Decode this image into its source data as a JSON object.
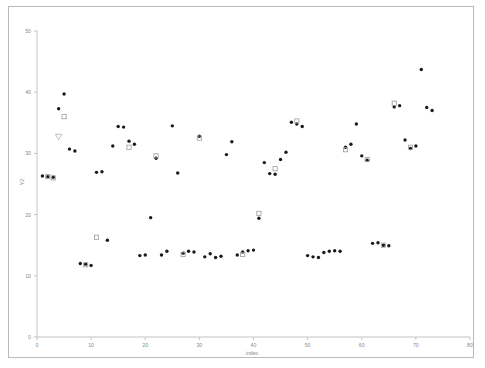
{
  "chart_data": {
    "type": "scatter",
    "title": "",
    "xlabel": "index",
    "ylabel": "Y2",
    "xlim": [
      0,
      80
    ],
    "ylim": [
      0,
      50
    ],
    "xticks": [
      0,
      10,
      20,
      30,
      40,
      50,
      60,
      70,
      80
    ],
    "yticks": [
      0,
      10,
      20,
      30,
      40,
      50
    ],
    "xtick_labels": [
      "0",
      "10",
      "20",
      "30",
      "40",
      "50",
      "60",
      "70",
      "80"
    ],
    "ytick_labels": [
      "0",
      "10",
      "20",
      "30",
      "40",
      "50"
    ],
    "grid": false,
    "legend": null,
    "series": [
      {
        "name": "filled-circle",
        "marker": "circle-filled",
        "color": "#1a1a1a",
        "points": [
          [
            1,
            26.3
          ],
          [
            2,
            26.2
          ],
          [
            3,
            26.1
          ],
          [
            4,
            37.3
          ],
          [
            5,
            39.7
          ],
          [
            6,
            30.7
          ],
          [
            7,
            30.4
          ],
          [
            8,
            12.0
          ],
          [
            9,
            11.9
          ],
          [
            10,
            11.7
          ],
          [
            11,
            26.9
          ],
          [
            12,
            27.0
          ],
          [
            13,
            15.8
          ],
          [
            14,
            31.2
          ],
          [
            15,
            34.4
          ],
          [
            16,
            34.3
          ],
          [
            17,
            32.0
          ],
          [
            18,
            31.5
          ],
          [
            19,
            13.3
          ],
          [
            20,
            13.4
          ],
          [
            21,
            19.5
          ],
          [
            22,
            29.2
          ],
          [
            23,
            13.4
          ],
          [
            24,
            14.0
          ],
          [
            25,
            34.5
          ],
          [
            26,
            26.8
          ],
          [
            27,
            13.7
          ],
          [
            28,
            14.0
          ],
          [
            29,
            13.9
          ],
          [
            30,
            32.8
          ],
          [
            31,
            13.1
          ],
          [
            32,
            13.6
          ],
          [
            33,
            13.0
          ],
          [
            34,
            13.2
          ],
          [
            35,
            29.8
          ],
          [
            36,
            31.9
          ],
          [
            37,
            13.4
          ],
          [
            38,
            13.9
          ],
          [
            39,
            14.1
          ],
          [
            40,
            14.2
          ],
          [
            41,
            19.4
          ],
          [
            42,
            28.5
          ],
          [
            43,
            26.7
          ],
          [
            44,
            26.6
          ],
          [
            45,
            29.0
          ],
          [
            46,
            30.2
          ],
          [
            47,
            35.1
          ],
          [
            48,
            34.8
          ],
          [
            49,
            34.4
          ],
          [
            50,
            13.3
          ],
          [
            51,
            13.1
          ],
          [
            52,
            13.0
          ],
          [
            53,
            13.8
          ],
          [
            54,
            14.0
          ],
          [
            55,
            14.1
          ],
          [
            56,
            14.0
          ],
          [
            57,
            31.0
          ],
          [
            58,
            31.5
          ],
          [
            59,
            34.8
          ],
          [
            60,
            29.6
          ],
          [
            61,
            28.9
          ],
          [
            62,
            15.3
          ],
          [
            63,
            15.4
          ],
          [
            64,
            15.0
          ],
          [
            65,
            14.9
          ],
          [
            66,
            37.6
          ],
          [
            67,
            37.8
          ],
          [
            68,
            32.2
          ],
          [
            69,
            30.8
          ],
          [
            70,
            31.2
          ],
          [
            71,
            43.7
          ],
          [
            72,
            37.5
          ],
          [
            73,
            37.0
          ]
        ]
      },
      {
        "name": "open-square",
        "marker": "square-open",
        "color": "#9b9b9b",
        "points": [
          [
            2,
            26.2
          ],
          [
            3,
            26.0
          ],
          [
            5,
            36.0
          ],
          [
            9,
            11.8
          ],
          [
            11,
            16.3
          ],
          [
            17,
            31.0
          ],
          [
            22,
            29.6
          ],
          [
            27,
            13.5
          ],
          [
            30,
            32.5
          ],
          [
            38,
            13.5
          ],
          [
            41,
            20.2
          ],
          [
            44,
            27.5
          ],
          [
            48,
            35.3
          ],
          [
            57,
            30.6
          ],
          [
            61,
            29.0
          ],
          [
            64,
            15.0
          ],
          [
            66,
            38.2
          ],
          [
            69,
            31.0
          ]
        ]
      },
      {
        "name": "open-triangle",
        "marker": "triangle-down-open",
        "color": "#b0b0b0",
        "points": [
          [
            4,
            32.7
          ]
        ]
      }
    ]
  },
  "axis": {
    "x_title": "index",
    "y_title": "Y2"
  }
}
